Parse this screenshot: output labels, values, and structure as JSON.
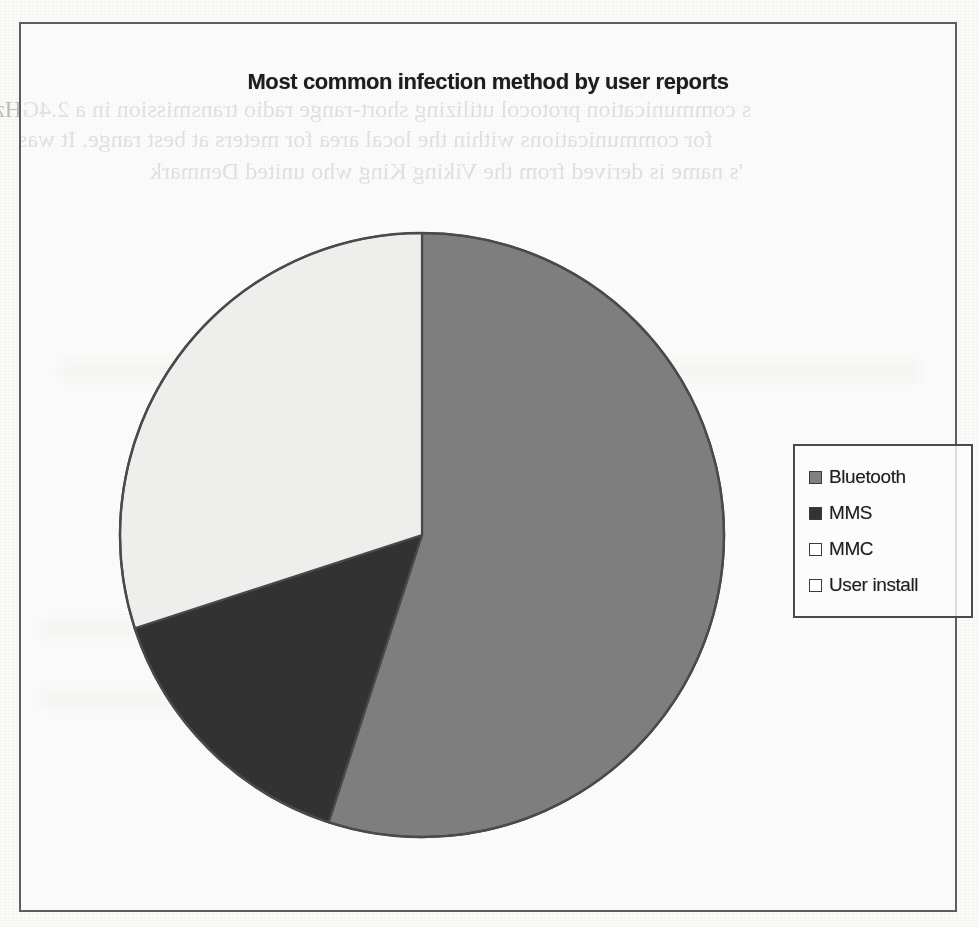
{
  "document": {
    "type": "scanned-page-chart",
    "background_bleed_text": [
      "s communication protocol utilizing short-range radio transmission in a 2.4GHz",
      "for communications within the local area for meters at best range. It was",
      "'s name is derived from the Viking King who united Denmark"
    ]
  },
  "chart_frame": {
    "border_color": "#5d5d5d"
  },
  "chart_data": {
    "type": "pie",
    "title": "Most common infection method by user reports",
    "categories": [
      "Bluetooth",
      "MMS",
      "MMC",
      "User install"
    ],
    "values": [
      55,
      15,
      30,
      0
    ],
    "unit": "percent",
    "colors": [
      "#808080",
      "#333333",
      "#f2f2f0",
      "#f2f2f0"
    ],
    "start_angle_deg": 0,
    "direction": "clockwise",
    "legend": {
      "position": "right",
      "border": true,
      "entries": [
        {
          "label": "Bluetooth",
          "swatch_color": "#808080",
          "value": 55
        },
        {
          "label": "MMS",
          "swatch_color": "#333333",
          "value": 15
        },
        {
          "label": "MMC",
          "swatch_color": "#ffffff",
          "value": 30
        },
        {
          "label": "User install",
          "swatch_color": "#ffffff",
          "value": 0
        }
      ]
    },
    "xlabel": "",
    "ylabel": "",
    "grid": false,
    "data_labels_shown": false
  },
  "slice_geometry": {
    "center_x": 304,
    "center_y": 304,
    "radius": 302,
    "outline_color": "#4a4a4a",
    "slices": [
      {
        "name": "Bluetooth",
        "start_deg": 0,
        "end_deg": 198
      },
      {
        "name": "MMS",
        "start_deg": 198,
        "end_deg": 252
      },
      {
        "name": "MMC",
        "start_deg": 252,
        "end_deg": 360
      },
      {
        "name": "User install",
        "start_deg": 360,
        "end_deg": 360
      }
    ]
  }
}
